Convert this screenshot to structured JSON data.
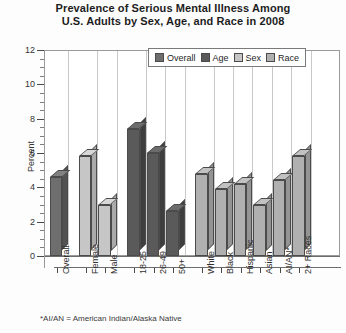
{
  "chart_data": {
    "type": "bar",
    "title": "Prevalence of Serious Mental Illness Among U.S. Adults by Sex, Age, and Race in 2008",
    "title_line1": "Prevalence of Serious Mental Illness Among",
    "title_line2": "U.S. Adults by Sex, Age, and Race in 2008",
    "xlabel": "",
    "ylabel": "Percent",
    "ylim": [
      0,
      12
    ],
    "yticks": [
      0,
      2,
      4,
      6,
      8,
      10,
      12
    ],
    "ytick_labels": [
      "0",
      "2",
      "4",
      "6",
      "8",
      "10",
      "12"
    ],
    "grid": "vertical",
    "legend_position": "top-right-inside",
    "legend": [
      "Overall",
      "Age",
      "Sex",
      "Race"
    ],
    "categories": [
      "Overall",
      "Female",
      "Male",
      "18-25",
      "26-49",
      "50+",
      "White",
      "Black",
      "Hispanic",
      "Asian",
      "AI/AN*",
      "2+ Races"
    ],
    "values": [
      4.6,
      5.8,
      3.0,
      7.4,
      6.0,
      2.6,
      4.8,
      3.9,
      4.2,
      3.0,
      4.4,
      5.8
    ],
    "series_of_bar": [
      "Overall",
      "Sex",
      "Sex",
      "Age",
      "Age",
      "Age",
      "Race",
      "Race",
      "Race",
      "Race",
      "Race",
      "Race"
    ],
    "annotations": [
      "*AI/AN = American Indian/Alaska Native"
    ]
  },
  "footnote": "*AI/AN = American Indian/Alaska Native",
  "colors": {
    "overall": "#6e6e6e",
    "age": "#5a5a5a",
    "sex": "#c6c6c6",
    "race": "#b0b0b0",
    "outline": "#4b4b4b",
    "grid": "#c9c9c9",
    "axis": "#4a4a4a",
    "background": "#ffffff"
  }
}
